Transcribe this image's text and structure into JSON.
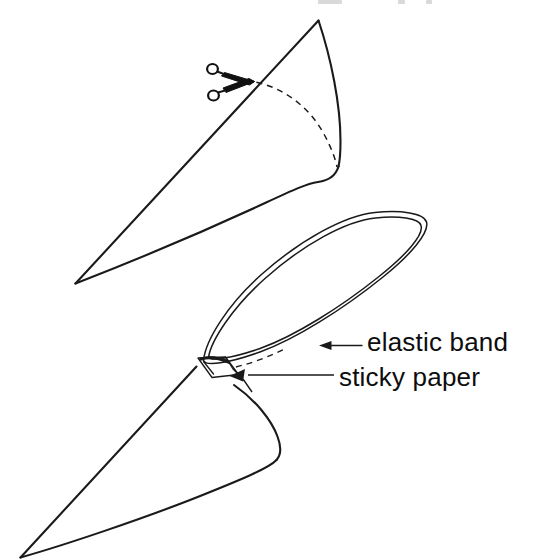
{
  "figure": {
    "background_color": "#ffffff",
    "ink_color": "#1a1a1a",
    "width": 554,
    "height": 560
  },
  "labels": {
    "elastic_band": "elastic band",
    "sticky_paper": "sticky paper"
  },
  "icons": {
    "scissors": "scissors-icon",
    "arrow_elastic": "arrow-left-icon",
    "arrow_sticky": "arrow-left-icon"
  },
  "steps": [
    {
      "id": "step-cut",
      "name": "upper-cone-being-cut",
      "description": "A rolled paper cone with a dashed cut line and scissors positioned on its upper edge"
    },
    {
      "id": "step-assemble",
      "name": "lower-cone-with-band",
      "description": "A rolled paper cone with an elastic band loop fastened to its tip using sticky paper"
    }
  ],
  "parts": [
    {
      "key": "elastic_band",
      "label": "elastic band",
      "shape": "elongated-loop"
    },
    {
      "key": "sticky_paper",
      "label": "sticky paper",
      "shape": "small-quadrilateral-tab"
    }
  ],
  "annotations": [
    {
      "target": "elastic_band",
      "arrow": "points-left",
      "label": "elastic band"
    },
    {
      "target": "sticky_paper",
      "arrow": "points-left",
      "label": "sticky paper"
    }
  ]
}
